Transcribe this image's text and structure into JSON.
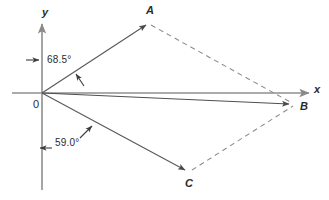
{
  "figure": {
    "type": "vector-parallelogram-diagram",
    "width": 329,
    "height": 200,
    "background": "#ffffff",
    "stroke_color": "#585858",
    "text_color": "#2b2b2b"
  },
  "axes": {
    "x_label": "x",
    "y_label": "y",
    "origin_label": "0",
    "x_axis": {
      "x1": 12,
      "y1": 93,
      "x2": 312,
      "y2": 93
    },
    "y_axis": {
      "x1": 42,
      "y1": 190,
      "x2": 42,
      "y2": 20
    }
  },
  "points": {
    "origin": {
      "label": "0",
      "x": 42,
      "y": 93
    },
    "A": {
      "label": "A",
      "x": 148,
      "y": 23
    },
    "B": {
      "label": "B",
      "x": 292,
      "y": 105
    },
    "C": {
      "label": "C",
      "x": 188,
      "y": 172
    }
  },
  "vectors": [
    {
      "name": "OA",
      "from": "origin",
      "to": "A",
      "style": "solid",
      "arrow": true
    },
    {
      "name": "OB",
      "from": "origin",
      "to": "B",
      "style": "solid",
      "arrow": true
    },
    {
      "name": "OC",
      "from": "origin",
      "to": "C",
      "style": "solid",
      "arrow": true
    }
  ],
  "construction_lines": [
    {
      "name": "A-to-B",
      "from": "A",
      "to": "B",
      "style": "dashed"
    },
    {
      "name": "C-to-B",
      "from": "C",
      "to": "B",
      "style": "dashed"
    }
  ],
  "angles": [
    {
      "name": "angle-OA-from-y-axis",
      "value": "68.5°",
      "label_x": 47,
      "label_y": 55
    },
    {
      "name": "angle-OC-from-y-axis",
      "value": "59.0°",
      "label_x": 55,
      "label_y": 138
    }
  ],
  "annotation_arrows": [
    {
      "name": "pointer-to-y-axis-upper",
      "direction": "right",
      "x": 27,
      "y": 60
    },
    {
      "name": "pointer-to-vector-OA",
      "direction": "up-left",
      "x": 84,
      "y": 84
    },
    {
      "name": "pointer-to-vector-OC",
      "direction": "up-right",
      "x": 82,
      "y": 136
    },
    {
      "name": "pointer-to-y-axis-lower",
      "direction": "left",
      "x": 51,
      "y": 148
    }
  ]
}
